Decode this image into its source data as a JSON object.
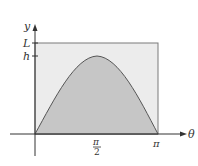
{
  "diagram": {
    "axes": {
      "x_label": "θ",
      "y_label": "y"
    },
    "y_ticks": [
      {
        "label": "L"
      },
      {
        "label": "h"
      }
    ],
    "x_ticks": [
      {
        "numerator": "π",
        "denominator": "2"
      },
      {
        "label": "π"
      }
    ],
    "regions": {
      "rectangle": {
        "description": "rectangle of height L from 0 to π",
        "fill": "#ececec"
      },
      "curve_area": {
        "description": "area under arch curve y = h·sin(θ) from 0 to π",
        "fill": "#c8c8c8"
      }
    },
    "colors": {
      "axis": "#333333",
      "rect_stroke": "#666666",
      "curve_stroke": "#555555"
    }
  }
}
